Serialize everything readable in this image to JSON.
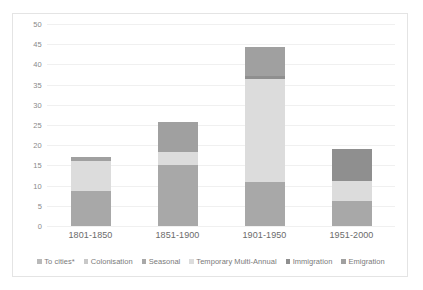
{
  "chart_data": {
    "type": "bar",
    "subtype": "stacked-bar",
    "title": "",
    "xlabel": "",
    "ylabel": "",
    "ylim": [
      0,
      50
    ],
    "ytick_step": 5,
    "yticks": [
      50,
      45,
      40,
      35,
      30,
      25,
      20,
      15,
      10,
      5,
      0
    ],
    "grid": true,
    "legend_position": "bottom",
    "categories": [
      "1801-1850",
      "1851-1900",
      "1901-1950",
      "1951-2000"
    ],
    "series": [
      {
        "name": "To cities*",
        "color": "#b9b9b9",
        "values": [
          0,
          0,
          0,
          0
        ]
      },
      {
        "name": "Colonisation",
        "color": "#c8c8c8",
        "values": [
          0,
          0,
          0,
          0
        ]
      },
      {
        "name": "Seasonal",
        "color": "#a8a8a8",
        "values": [
          8.7,
          15.0,
          11.0,
          6.3
        ]
      },
      {
        "name": "Temporary Multi-Annual",
        "color": "#dcdcdc",
        "values": [
          7.3,
          3.4,
          25.5,
          4.9
        ]
      },
      {
        "name": "Immigration",
        "color": "#8f8f8f",
        "values": [
          0,
          0,
          0.6,
          7.8
        ]
      },
      {
        "name": "Emigration",
        "color": "#a0a0a0",
        "values": [
          1.0,
          7.3,
          7.2,
          0
        ]
      }
    ],
    "totals": [
      17.0,
      25.7,
      44.3,
      19.0
    ]
  },
  "legend": {
    "items": [
      {
        "label": "To cities*",
        "color": "#b9b9b9"
      },
      {
        "label": "Colonisation",
        "color": "#c8c8c8"
      },
      {
        "label": "Seasonal",
        "color": "#a8a8a8"
      },
      {
        "label": "Temporary Multi-Annual",
        "color": "#dcdcdc"
      },
      {
        "label": "Immigration",
        "color": "#8f8f8f"
      },
      {
        "label": "Emigration",
        "color": "#a0a0a0"
      }
    ]
  }
}
